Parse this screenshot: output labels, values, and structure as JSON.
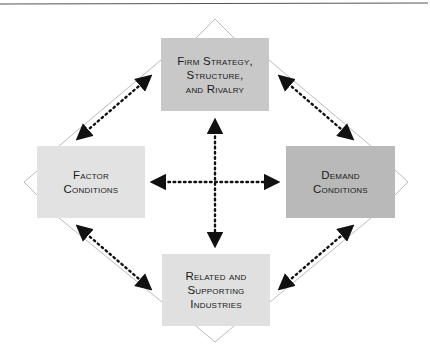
{
  "diagram": {
    "colors": {
      "top_box": "#c8c8c8",
      "side_box_light": "#e2e2e2",
      "right_box": "#b9b9b9",
      "bottom_box": "#e0e0e0",
      "outline": "#aaaaaa",
      "arrow": "#111111",
      "rule": "#555555"
    },
    "nodes": {
      "top": {
        "lines": [
          "Firm Strategy,",
          "Structure,",
          "and Rivalry"
        ]
      },
      "left": {
        "lines": [
          "Factor",
          "Conditions"
        ]
      },
      "right": {
        "lines": [
          "Demand",
          "Conditions"
        ]
      },
      "bottom": {
        "lines": [
          "Related and",
          "Supporting",
          "Industries"
        ]
      }
    },
    "arrows": [
      {
        "from": "top",
        "to": "left",
        "style": "dotted-bidirectional"
      },
      {
        "from": "top",
        "to": "right",
        "style": "dotted-bidirectional"
      },
      {
        "from": "left",
        "to": "bottom",
        "style": "dotted-bidirectional"
      },
      {
        "from": "right",
        "to": "bottom",
        "style": "dotted-bidirectional"
      },
      {
        "from": "left",
        "to": "right",
        "style": "dotted-bidirectional"
      },
      {
        "from": "top",
        "to": "bottom",
        "style": "dotted-bidirectional"
      }
    ]
  }
}
